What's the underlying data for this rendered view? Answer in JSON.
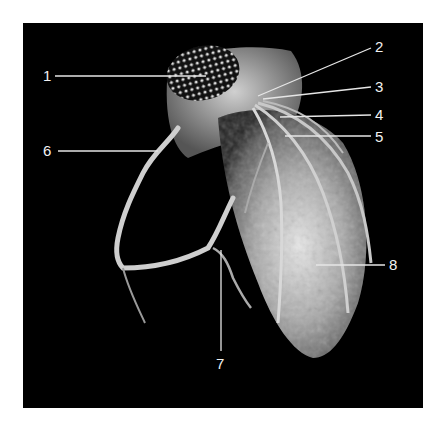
{
  "figure": {
    "background": "#000000",
    "labels": [
      {
        "id": "1",
        "text": "1"
      },
      {
        "id": "2",
        "text": "2"
      },
      {
        "id": "3",
        "text": "3"
      },
      {
        "id": "4",
        "text": "4"
      },
      {
        "id": "5",
        "text": "5"
      },
      {
        "id": "6",
        "text": "6"
      },
      {
        "id": "7",
        "text": "7"
      },
      {
        "id": "8",
        "text": "8"
      }
    ]
  }
}
